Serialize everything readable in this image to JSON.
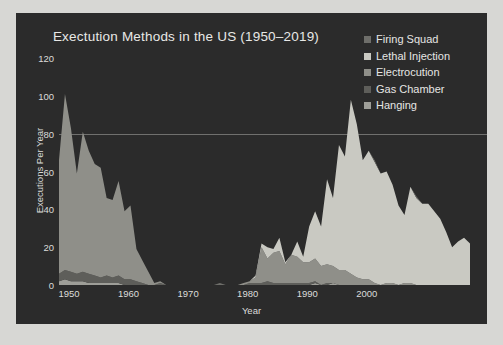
{
  "chart_data": {
    "type": "area",
    "stacked": true,
    "title": "Exectution Methods in the US (1950–2019)",
    "xlabel": "Year",
    "ylabel": "Executions Per Year",
    "xlim": [
      1950,
      2019
    ],
    "ylim": [
      0,
      128
    ],
    "yticks": [
      0,
      20,
      40,
      60,
      80,
      100,
      120
    ],
    "xticks": [
      1950,
      1960,
      1970,
      1980,
      1990,
      2000
    ],
    "grid": false,
    "legend_position": "top-right",
    "legend": [
      "Firing Squad",
      "Lethal Injection",
      "Electrocution",
      "Gas Chamber",
      "Hanging"
    ],
    "colors": {
      "Firing Squad": "#6e6e6a",
      "Lethal Injection": "#c9c9c2",
      "Electrocution": "#8f8f89",
      "Gas Chamber": "#5e5e5a",
      "Hanging": "#9e9e98",
      "panel_background": "#2b2b2b",
      "page_background": "#d7d7d4",
      "text": "#e6e6e4"
    },
    "x": [
      1950,
      1951,
      1952,
      1953,
      1954,
      1955,
      1956,
      1957,
      1958,
      1959,
      1960,
      1961,
      1962,
      1963,
      1964,
      1965,
      1966,
      1967,
      1968,
      1969,
      1970,
      1971,
      1972,
      1973,
      1974,
      1975,
      1976,
      1977,
      1978,
      1979,
      1980,
      1981,
      1982,
      1983,
      1984,
      1985,
      1986,
      1987,
      1988,
      1989,
      1990,
      1991,
      1992,
      1993,
      1994,
      1995,
      1996,
      1997,
      1998,
      1999,
      2000,
      2001,
      2002,
      2003,
      2004,
      2005,
      2006,
      2007,
      2008,
      2009,
      2010,
      2011,
      2012,
      2013,
      2014,
      2015,
      2016,
      2017,
      2018,
      2019
    ],
    "series": [
      {
        "name": "Hanging",
        "values": [
          2,
          3,
          2,
          2,
          2,
          1,
          1,
          1,
          1,
          1,
          1,
          0,
          0,
          0,
          0,
          0,
          0,
          0,
          0,
          0,
          0,
          0,
          0,
          0,
          0,
          0,
          0,
          0,
          0,
          0,
          0,
          0,
          0,
          0,
          0,
          0,
          0,
          0,
          0,
          0,
          0,
          0,
          0,
          1,
          0,
          0,
          1,
          0,
          0,
          0,
          0,
          0,
          0,
          0,
          0,
          0,
          0,
          0,
          0,
          0,
          0,
          0,
          0,
          0,
          0,
          0,
          0,
          0,
          0,
          0
        ]
      },
      {
        "name": "Gas Chamber",
        "values": [
          4,
          5,
          5,
          4,
          5,
          5,
          4,
          3,
          4,
          3,
          4,
          3,
          3,
          2,
          1,
          0,
          0,
          1,
          0,
          0,
          0,
          0,
          0,
          0,
          0,
          0,
          0,
          0,
          0,
          0,
          0,
          0,
          1,
          1,
          1,
          2,
          1,
          1,
          1,
          1,
          1,
          1,
          1,
          1,
          0,
          1,
          0,
          0,
          0,
          0,
          0,
          0,
          0,
          0,
          0,
          0,
          0,
          0,
          0,
          0,
          0,
          0,
          0,
          0,
          0,
          0,
          0,
          0,
          0,
          0
        ]
      },
      {
        "name": "Electrocution",
        "values": [
          60,
          93,
          76,
          53,
          74,
          65,
          59,
          58,
          41,
          41,
          50,
          36,
          39,
          17,
          12,
          7,
          1,
          1,
          0,
          0,
          0,
          0,
          0,
          0,
          0,
          0,
          0,
          0,
          0,
          0,
          0,
          1,
          1,
          3,
          19,
          12,
          16,
          17,
          10,
          15,
          14,
          11,
          11,
          12,
          10,
          10,
          9,
          8,
          8,
          6,
          4,
          3,
          3,
          1,
          0,
          1,
          1,
          0,
          1,
          1,
          0,
          0,
          0,
          0,
          0,
          0,
          0,
          0,
          0,
          0
        ]
      },
      {
        "name": "Lethal Injection",
        "values": [
          0,
          0,
          0,
          0,
          0,
          0,
          0,
          0,
          0,
          0,
          0,
          0,
          0,
          0,
          0,
          0,
          0,
          0,
          0,
          0,
          0,
          0,
          0,
          0,
          0,
          0,
          0,
          0,
          0,
          0,
          0,
          0,
          0,
          1,
          2,
          6,
          2,
          7,
          1,
          0,
          8,
          3,
          19,
          25,
          21,
          45,
          36,
          66,
          60,
          92,
          81,
          63,
          68,
          64,
          59,
          59,
          52,
          42,
          36,
          51,
          46,
          43,
          43,
          39,
          35,
          28,
          20,
          23,
          25,
          22
        ]
      },
      {
        "name": "Firing Squad",
        "values": [
          0,
          0,
          0,
          0,
          0,
          0,
          0,
          0,
          0,
          0,
          0,
          0,
          0,
          0,
          0,
          0,
          0,
          0,
          0,
          0,
          0,
          0,
          0,
          0,
          0,
          0,
          0,
          1,
          0,
          0,
          0,
          0,
          0,
          0,
          0,
          0,
          0,
          0,
          0,
          0,
          0,
          0,
          0,
          0,
          0,
          0,
          0,
          0,
          0,
          0,
          0,
          0,
          0,
          1,
          0,
          0,
          0,
          0,
          0,
          0,
          1,
          0,
          0,
          0,
          0,
          0,
          0,
          0,
          0,
          0
        ]
      }
    ]
  }
}
